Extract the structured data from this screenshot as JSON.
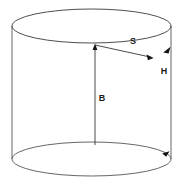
{
  "figure": {
    "shape": "cylinder",
    "background_color": "#ffffff",
    "outline_color": "#55555a",
    "measure_color": "#2a2a2e",
    "label_color": "#1a1a1a",
    "labels": {
      "slant": "S",
      "height": "H",
      "axis": "B"
    },
    "label_positions": {
      "slant": {
        "x": 133,
        "y": 42
      },
      "height": {
        "x": 164,
        "y": 72
      },
      "axis": {
        "x": 102,
        "y": 99
      }
    },
    "geometry": {
      "top_ellipse": {
        "cx": 91.5,
        "cy": 26,
        "rx": 79.5,
        "ry": 17
      },
      "bottom_ellipse": {
        "cx": 91.5,
        "cy": 159,
        "rx": 79.5,
        "ry": 17
      },
      "left_wall_x": 12,
      "right_wall_x": 171,
      "wall_top_y": 26,
      "wall_bottom_y": 159,
      "axis_line": {
        "x": 95,
        "y_top": 45,
        "y_bottom": 145
      },
      "slant_line": {
        "x1": 95,
        "y1": 45,
        "x2": 152,
        "y2": 58
      },
      "height_top_arrow": {
        "x": 170,
        "y": 48
      },
      "height_bottom_arrow": {
        "x": 167,
        "y": 152
      }
    }
  }
}
